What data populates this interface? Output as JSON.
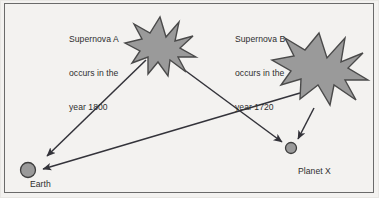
{
  "diagram": {
    "background_color": "#f3f2f0",
    "border_color": "#6a6a6a",
    "shape_fill_color": "#9a9a9a",
    "shape_stroke_color": "#4a4a4a",
    "arrow_color": "#33333a",
    "text_color": "#2e2e2e",
    "labels": {
      "supernova_a": {
        "line1": "Supernova A",
        "line2": "occurs in the",
        "line3": "year 1800"
      },
      "supernova_b": {
        "line1": "Supernova B",
        "line2": "occurs in the",
        "line3": "year 1720"
      },
      "earth": "Earth",
      "planet_x": "Planet X"
    },
    "bodies": [
      {
        "name": "Earth",
        "cx": 28,
        "cy": 170,
        "r": 7.5
      },
      {
        "name": "Planet X",
        "cx": 291,
        "cy": 148,
        "r": 5.5
      }
    ],
    "stars": [
      {
        "name": "Supernova A",
        "cx": 160,
        "cy": 45,
        "radius_outer": 27,
        "radius_inner": 12
      },
      {
        "name": "Supernova B",
        "cx": 320,
        "cy": 70,
        "radius_outer": 36,
        "radius_inner": 16
      }
    ],
    "arrows": [
      {
        "name": "supernova-a-to-earth",
        "from": "Supernova A",
        "to": "Earth",
        "x1": 145,
        "y1": 60,
        "x2": 46,
        "y2": 157
      },
      {
        "name": "supernova-a-to-planet-x",
        "from": "Supernova A",
        "to": "Planet X",
        "x1": 174,
        "y1": 62,
        "x2": 283,
        "y2": 143
      },
      {
        "name": "supernova-b-to-earth",
        "from": "Supernova B",
        "to": "Earth",
        "x1": 300,
        "y1": 93,
        "x2": 41,
        "y2": 170
      },
      {
        "name": "supernova-b-to-planet-x",
        "from": "Supernova B",
        "to": "Planet X",
        "x1": 313,
        "y1": 110,
        "x2": 297,
        "y2": 140
      }
    ]
  }
}
